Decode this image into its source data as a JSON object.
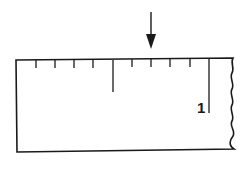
{
  "diagram": {
    "type": "ruler",
    "ruler": {
      "label": "1",
      "divisions_per_unit": 10,
      "ticks": [
        0.1,
        0.2,
        0.3,
        0.4,
        0.5,
        0.6,
        0.7,
        0.8,
        0.9,
        1.0
      ],
      "half_mark": 0.5,
      "unit_mark": 1.0
    },
    "arrow": {
      "points_to": 0.7,
      "direction": "down"
    },
    "colors": {
      "line": "#1a1a1a",
      "background": "#ffffff"
    }
  }
}
